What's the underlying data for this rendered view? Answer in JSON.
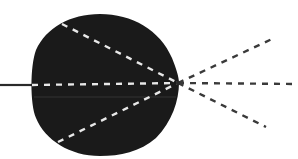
{
  "diagram": {
    "colors": {
      "background": "#ffffff",
      "body": "#1a1a1a",
      "inner_rays": "#e8e8e8",
      "outer_rays": "#3a3a3a",
      "incoming_line": "#2a2a2a"
    },
    "focal_point": {
      "x": 178,
      "y": 83
    },
    "incoming_line": {
      "x1": 0,
      "y1": 85,
      "x2": 32,
      "y2": 85
    },
    "inner_rays": [
      {
        "name": "upper-inner-ray",
        "x1": 62,
        "y1": 24,
        "x2": 178,
        "y2": 83
      },
      {
        "name": "axis-inner-ray",
        "x1": 32,
        "y1": 85,
        "x2": 178,
        "y2": 83
      },
      {
        "name": "lower-inner-ray",
        "x1": 58,
        "y1": 142,
        "x2": 178,
        "y2": 83
      }
    ],
    "outer_rays": [
      {
        "name": "upper-outer-ray",
        "x1": 178,
        "y1": 83,
        "x2": 272,
        "y2": 39
      },
      {
        "name": "axis-outer-ray",
        "x1": 178,
        "y1": 83,
        "x2": 298,
        "y2": 84
      },
      {
        "name": "lower-outer-ray",
        "x1": 178,
        "y1": 83,
        "x2": 266,
        "y2": 127
      }
    ]
  }
}
